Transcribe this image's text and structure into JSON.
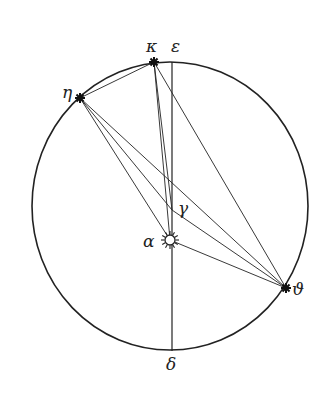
{
  "diagram": {
    "type": "geometric-astronomical-figure",
    "stroke_color": "#222222",
    "background": "#ffffff",
    "circle": {
      "cx": 170,
      "cy": 206,
      "rx": 138,
      "ry": 144
    },
    "vertical_line": {
      "x1": 172,
      "y1": 62,
      "x2": 172,
      "y2": 351
    },
    "points": {
      "kappa": {
        "label": "κ",
        "x": 154,
        "y": 62,
        "marker": "star",
        "label_x": 146,
        "label_y": 52
      },
      "epsilon": {
        "label": "ε",
        "x": 172,
        "y": 62,
        "marker": "none",
        "label_x": 171,
        "label_y": 52
      },
      "eta": {
        "label": "η",
        "x": 80,
        "y": 98,
        "marker": "star",
        "label_x": 62,
        "label_y": 98
      },
      "gamma": {
        "label": "γ",
        "x": 172,
        "y": 210,
        "marker": "none",
        "label_x": 178,
        "label_y": 214
      },
      "alpha": {
        "label": "α",
        "x": 170,
        "y": 240,
        "marker": "sun",
        "label_x": 143,
        "label_y": 247
      },
      "theta": {
        "label": "ϑ",
        "x": 286,
        "y": 288,
        "marker": "star",
        "label_x": 292,
        "label_y": 295
      },
      "delta": {
        "label": "δ",
        "x": 172,
        "y": 351,
        "marker": "none",
        "label_x": 166,
        "label_y": 370
      }
    },
    "segments": [
      {
        "from": "eta",
        "to": "kappa"
      },
      {
        "from": "kappa",
        "to": "alpha"
      },
      {
        "from": "kappa",
        "to": "theta"
      },
      {
        "from": "eta",
        "to": "gamma"
      },
      {
        "from": "eta",
        "to": "alpha"
      },
      {
        "from": "eta",
        "to": "theta"
      },
      {
        "from": "gamma",
        "to": "theta"
      },
      {
        "from": "alpha",
        "to": "theta"
      },
      {
        "from": "kappa",
        "to": "gamma"
      }
    ]
  }
}
